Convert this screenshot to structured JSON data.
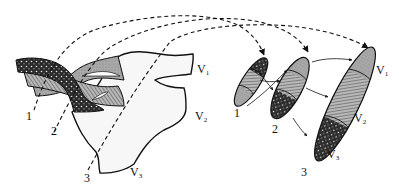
{
  "diagram": {
    "left_structure": {
      "bundle_labels": [
        "1",
        "2",
        "3"
      ],
      "region_labels": [
        {
          "main": "V",
          "sub": "1"
        },
        {
          "main": "V",
          "sub": "2"
        },
        {
          "main": "V",
          "sub": "3"
        }
      ]
    },
    "right_structure": {
      "target_labels": [
        "1",
        "2",
        "3"
      ],
      "region_labels": [
        {
          "main": "V",
          "sub": "1"
        },
        {
          "main": "V",
          "sub": "2"
        },
        {
          "main": "V",
          "sub": "3"
        }
      ]
    },
    "colors": {
      "dark_fill": "#2a2a2a",
      "mid_fill": "#a8a8a8",
      "light_fill": "#f7f7f7",
      "stroke": "#111111"
    }
  }
}
